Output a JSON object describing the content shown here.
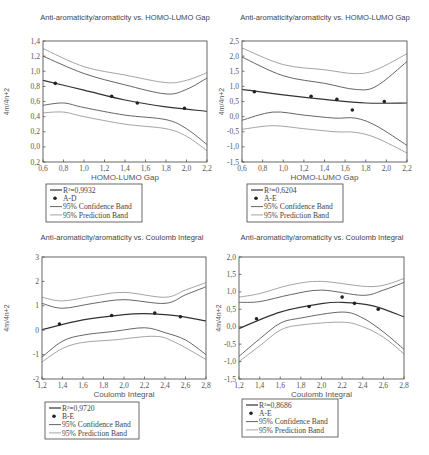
{
  "chart_data": [
    {
      "type": "scatter",
      "title": "Anti-aromaticity/aromaticity vs. HOMO-LUMO Gap",
      "xlabel": "HOMO-LUMO Gap",
      "ylabel": "4m/4n+2",
      "xlim": [
        0.6,
        2.2
      ],
      "ylim": [
        -0.2,
        1.4
      ],
      "xticks": [
        "0,6",
        "0,8",
        "1,0",
        "1,2",
        "1,4",
        "1,6",
        "1,8",
        "2,0",
        "2,2"
      ],
      "yticks": [
        "0,2",
        "0,0",
        "0,2",
        "0,4",
        "0,6",
        "0,8",
        "1,0",
        "1,2",
        "1,4"
      ],
      "legend": [
        "R²=0,9932",
        "A-D",
        "95% Confidence Band",
        "95% Prediction Band"
      ],
      "points": {
        "name": "A-D",
        "x": [
          0.72,
          1.27,
          1.52,
          1.98
        ],
        "y": [
          0.84,
          0.67,
          0.58,
          0.51
        ]
      },
      "fit": {
        "name": "R²=0,9932",
        "x": [
          0.6,
          1.0,
          1.4,
          1.8,
          2.2
        ],
        "y": [
          0.88,
          0.75,
          0.62,
          0.53,
          0.47
        ]
      },
      "confidence_upper": {
        "x": [
          0.6,
          1.0,
          1.4,
          1.8,
          2.0,
          2.2
        ],
        "y": [
          1.2,
          0.97,
          0.82,
          0.7,
          0.76,
          0.91
        ]
      },
      "confidence_lower": {
        "x": [
          0.6,
          0.8,
          1.0,
          1.4,
          1.8,
          2.0,
          2.2
        ],
        "y": [
          0.55,
          0.58,
          0.52,
          0.42,
          0.36,
          0.24,
          0.03
        ]
      },
      "prediction_upper": {
        "x": [
          0.6,
          1.0,
          1.4,
          1.8,
          2.0,
          2.2
        ],
        "y": [
          1.3,
          1.06,
          0.95,
          0.85,
          0.88,
          0.98
        ]
      },
      "prediction_lower": {
        "x": [
          0.6,
          0.8,
          1.0,
          1.4,
          1.8,
          2.0,
          2.2
        ],
        "y": [
          0.45,
          0.46,
          0.4,
          0.3,
          0.24,
          0.14,
          -0.05
        ]
      },
      "legend_position": "below",
      "grid": false
    },
    {
      "type": "scatter",
      "title": "Anti-aromaticity/aromaticity vs. HOMO-LUMO Gap",
      "xlabel": "HOMO-LUMO Gap",
      "ylabel": "4m/4n+2",
      "xlim": [
        0.6,
        2.2
      ],
      "ylim": [
        -1.5,
        2.5
      ],
      "xticks": [
        "0,6",
        "0,8",
        "1,0",
        "1,2",
        "1,4",
        "1,6",
        "1,8",
        "2,0",
        "2,2"
      ],
      "yticks": [
        "-1,5",
        "-1,0",
        "-0,5",
        "0,0",
        "0,5",
        "1,0",
        "1,5",
        "2,0",
        "2,5"
      ],
      "legend": [
        "R²=0,6204",
        "A-E",
        "95% Confidence Band",
        "95% Prediction Band"
      ],
      "points": {
        "name": "A-E",
        "x": [
          0.72,
          1.27,
          1.52,
          1.67,
          1.98
        ],
        "y": [
          0.82,
          0.67,
          0.57,
          0.22,
          0.5
        ]
      },
      "fit": {
        "name": "R²=0,6204",
        "x": [
          0.6,
          1.0,
          1.4,
          1.8,
          2.2
        ],
        "y": [
          0.9,
          0.72,
          0.57,
          0.45,
          0.45
        ]
      },
      "confidence_upper": {
        "x": [
          0.6,
          1.0,
          1.4,
          1.7,
          1.9,
          2.2
        ],
        "y": [
          1.97,
          1.35,
          1.1,
          0.9,
          1.0,
          1.82
        ]
      },
      "confidence_lower": {
        "x": [
          0.6,
          0.9,
          1.2,
          1.5,
          1.7,
          1.9,
          2.2
        ],
        "y": [
          -0.12,
          0.15,
          0.05,
          -0.05,
          -0.05,
          -0.3,
          -0.95
        ]
      },
      "prediction_upper": {
        "x": [
          0.6,
          1.0,
          1.4,
          1.7,
          1.9,
          2.2
        ],
        "y": [
          2.27,
          1.72,
          1.55,
          1.42,
          1.55,
          2.08
        ]
      },
      "prediction_lower": {
        "x": [
          0.6,
          0.9,
          1.2,
          1.5,
          1.7,
          1.9,
          2.2
        ],
        "y": [
          -0.42,
          -0.3,
          -0.4,
          -0.5,
          -0.52,
          -0.7,
          -1.2
        ]
      },
      "legend_position": "below",
      "grid": false
    },
    {
      "type": "scatter",
      "title": "Anti-aromaticity/aromaticity vs. Coulomb Integral",
      "xlabel": "Coulomb Integral",
      "ylabel": "4m/4n+2",
      "xlim": [
        1.2,
        2.8
      ],
      "ylim": [
        -2,
        3
      ],
      "xticks": [
        "1,2",
        "1,4",
        "1,6",
        "1,8",
        "2,0",
        "2,2",
        "2,4",
        "2,6",
        "2,8"
      ],
      "yticks": [
        "-2",
        "-1",
        "0",
        "1",
        "2",
        "3"
      ],
      "legend": [
        "R²=0,9720",
        "B-E",
        "95% Confidence Band",
        "95% Prediction Band"
      ],
      "points": {
        "name": "B-E",
        "x": [
          1.37,
          1.88,
          2.3,
          2.55
        ],
        "y": [
          0.25,
          0.6,
          0.7,
          0.55
        ]
      },
      "fit": {
        "name": "R²=0,9720",
        "x": [
          1.2,
          1.6,
          2.0,
          2.2,
          2.5,
          2.8
        ],
        "y": [
          0.02,
          0.42,
          0.64,
          0.68,
          0.6,
          0.38
        ]
      },
      "confidence_upper": {
        "x": [
          1.2,
          1.4,
          1.7,
          2.0,
          2.4,
          2.6,
          2.8
        ],
        "y": [
          1.1,
          0.9,
          1.1,
          1.25,
          1.1,
          1.45,
          1.78
        ]
      },
      "confidence_lower": {
        "x": [
          1.2,
          1.4,
          1.6,
          1.9,
          2.2,
          2.4,
          2.6,
          2.8
        ],
        "y": [
          -1.1,
          -0.45,
          -0.2,
          -0.05,
          0.1,
          -0.1,
          -0.4,
          -1.0
        ]
      },
      "prediction_upper": {
        "x": [
          1.2,
          1.4,
          1.7,
          2.0,
          2.4,
          2.6,
          2.8
        ],
        "y": [
          1.35,
          1.2,
          1.4,
          1.55,
          1.35,
          1.65,
          1.95
        ]
      },
      "prediction_lower": {
        "x": [
          1.2,
          1.4,
          1.6,
          1.9,
          2.3,
          2.5,
          2.8
        ],
        "y": [
          -1.3,
          -0.75,
          -0.5,
          -0.4,
          -0.25,
          -0.5,
          -1.2
        ]
      },
      "legend_position": "below",
      "grid": false
    },
    {
      "type": "scatter",
      "title": "Anti-aromaticity/aromaticity vs. Coulomb Integral",
      "xlabel": "Coulomb Integral",
      "ylabel": "4m/4n+2",
      "xlim": [
        1.2,
        2.8
      ],
      "ylim": [
        -1.5,
        2.0
      ],
      "xticks": [
        "1,2",
        "1,4",
        "1,6",
        "1,8",
        "2,0",
        "2,2",
        "2,4",
        "2,6",
        "2,8"
      ],
      "yticks": [
        "-1,5",
        "-1,0",
        "-0,5",
        "0,0",
        "0,5",
        "1,0",
        "1,5",
        "2,0"
      ],
      "legend": [
        "R²=0,8686",
        "A-E",
        "95% Confidence Band",
        "95% Prediction Band"
      ],
      "points": {
        "name": "A-E",
        "x": [
          1.37,
          1.88,
          2.2,
          2.32,
          2.55
        ],
        "y": [
          0.23,
          0.58,
          0.85,
          0.67,
          0.5
        ]
      },
      "fit": {
        "name": "R²=0,8686",
        "x": [
          1.2,
          1.6,
          2.0,
          2.2,
          2.5,
          2.8
        ],
        "y": [
          -0.05,
          0.42,
          0.66,
          0.7,
          0.6,
          0.28
        ]
      },
      "confidence_upper": {
        "x": [
          1.2,
          1.4,
          1.7,
          2.0,
          2.4,
          2.6,
          2.8
        ],
        "y": [
          0.7,
          0.72,
          0.92,
          1.05,
          0.9,
          1.05,
          1.27
        ]
      },
      "confidence_lower": {
        "x": [
          1.2,
          1.4,
          1.6,
          1.8,
          2.2,
          2.4,
          2.6,
          2.8
        ],
        "y": [
          -0.85,
          -0.35,
          0.1,
          0.25,
          0.42,
          0.25,
          -0.15,
          -0.65
        ]
      },
      "prediction_upper": {
        "x": [
          1.2,
          1.4,
          1.7,
          2.0,
          2.5,
          2.8
        ],
        "y": [
          0.85,
          0.95,
          1.2,
          1.3,
          1.15,
          1.38
        ]
      },
      "prediction_lower": {
        "x": [
          1.2,
          1.4,
          1.6,
          1.8,
          2.2,
          2.4,
          2.6,
          2.8
        ],
        "y": [
          -1.0,
          -0.55,
          -0.1,
          0.05,
          0.13,
          0.0,
          -0.3,
          -0.78
        ]
      },
      "legend_position": "below",
      "grid": false
    }
  ],
  "layout": {
    "frames": [
      {
        "left": 43,
        "top": 41,
        "right": 207,
        "bottom": 162,
        "title_x": 125,
        "title_y": 20,
        "ylabel_x": 9,
        "legend": {
          "x": 46,
          "y": 184,
          "w": 96,
          "h": 38
        }
      },
      {
        "left": 242,
        "top": 41,
        "right": 407,
        "bottom": 162,
        "title_x": 325,
        "title_y": 20,
        "ylabel_x": 224,
        "legend": {
          "x": 247,
          "y": 184,
          "w": 96,
          "h": 38
        }
      },
      {
        "left": 42,
        "top": 257,
        "right": 206,
        "bottom": 379,
        "title_x": 122,
        "title_y": 240,
        "ylabel_x": 9,
        "legend": {
          "x": 45,
          "y": 402,
          "w": 94,
          "h": 37
        }
      },
      {
        "left": 239,
        "top": 257,
        "right": 404,
        "bottom": 379,
        "title_x": 322,
        "title_y": 240,
        "ylabel_x": 221,
        "legend": {
          "x": 242,
          "y": 399,
          "w": 96,
          "h": 38
        }
      }
    ],
    "colors": {
      "fit": "#333333",
      "confidence": "#555555",
      "prediction": "#9a9a9a",
      "points": "#222222",
      "axis": "#555555"
    }
  }
}
